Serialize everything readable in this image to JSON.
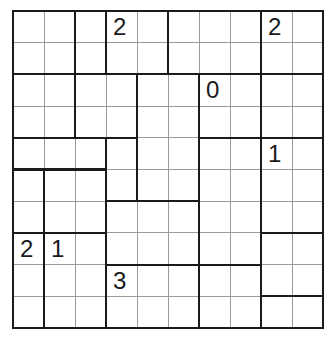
{
  "puzzle": {
    "cols": 10,
    "rows": 10,
    "regions": [
      {
        "c": 0,
        "r": 0,
        "w": 2,
        "h": 2
      },
      {
        "c": 2,
        "r": 0,
        "w": 1,
        "h": 2
      },
      {
        "c": 3,
        "r": 0,
        "w": 2,
        "h": 2
      },
      {
        "c": 5,
        "r": 0,
        "w": 3,
        "h": 2
      },
      {
        "c": 8,
        "r": 0,
        "w": 2,
        "h": 2
      },
      {
        "c": 0,
        "r": 2,
        "w": 2,
        "h": 2
      },
      {
        "c": 2,
        "r": 2,
        "w": 2,
        "h": 2
      },
      {
        "c": 4,
        "r": 2,
        "w": 2,
        "h": 4
      },
      {
        "c": 6,
        "r": 2,
        "w": 2,
        "h": 2
      },
      {
        "c": 8,
        "r": 2,
        "w": 2,
        "h": 2
      },
      {
        "c": 0,
        "r": 4,
        "w": 3,
        "h": 1
      },
      {
        "c": 3,
        "r": 4,
        "w": 1,
        "h": 2
      },
      {
        "c": 6,
        "r": 4,
        "w": 2,
        "h": 4
      },
      {
        "c": 8,
        "r": 4,
        "w": 2,
        "h": 3
      },
      {
        "c": 0,
        "r": 5,
        "w": 1,
        "h": 2
      },
      {
        "c": 1,
        "r": 5,
        "w": 2,
        "h": 2
      },
      {
        "c": 3,
        "r": 6,
        "w": 3,
        "h": 2
      },
      {
        "c": 0,
        "r": 7,
        "w": 1,
        "h": 3
      },
      {
        "c": 1,
        "r": 7,
        "w": 2,
        "h": 3
      },
      {
        "c": 8,
        "r": 7,
        "w": 2,
        "h": 2
      },
      {
        "c": 3,
        "r": 8,
        "w": 3,
        "h": 2
      },
      {
        "c": 6,
        "r": 8,
        "w": 2,
        "h": 2
      },
      {
        "c": 8,
        "r": 9,
        "w": 2,
        "h": 1
      }
    ],
    "clues": [
      {
        "c": 3,
        "r": 0,
        "value": "2"
      },
      {
        "c": 8,
        "r": 0,
        "value": "2"
      },
      {
        "c": 6,
        "r": 2,
        "value": "0"
      },
      {
        "c": 8,
        "r": 4,
        "value": "1"
      },
      {
        "c": 0,
        "r": 7,
        "value": "2"
      },
      {
        "c": 1,
        "r": 7,
        "value": "1"
      },
      {
        "c": 3,
        "r": 8,
        "value": "3"
      }
    ]
  },
  "colors": {
    "thick_line": "#1a1a1a",
    "thin_line": "#9a9a9a",
    "background": "#ffffff"
  }
}
